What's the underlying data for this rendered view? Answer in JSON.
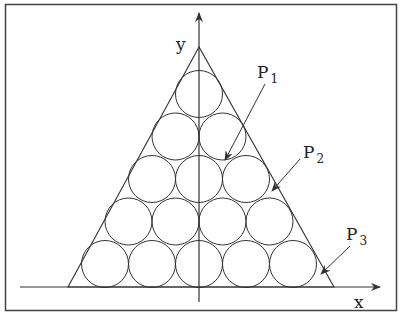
{
  "diagram": {
    "axes": {
      "x_label": "x",
      "y_label": "y"
    },
    "points": [
      {
        "name": "P",
        "sub": "1"
      },
      {
        "name": "P",
        "sub": "2"
      },
      {
        "name": "P",
        "sub": "3"
      }
    ],
    "circle_rows": [
      1,
      2,
      3,
      4,
      5
    ],
    "colors": {
      "stroke": "#333333",
      "background": "#ffffff"
    }
  }
}
